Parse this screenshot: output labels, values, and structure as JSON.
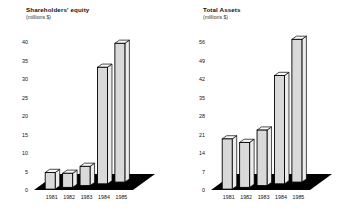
{
  "charts": [
    {
      "id": "shareholders-equity",
      "title": "Shareholders' equity",
      "subtitle": "(millions $)",
      "categories": [
        "1981",
        "1982",
        "1983",
        "1984",
        "1985"
      ],
      "values": [
        4.5,
        3.8,
        5.2,
        31.5,
        37.5
      ],
      "yticks": [
        "0",
        "5",
        "10",
        "15",
        "20",
        "25",
        "30",
        "35",
        "40"
      ],
      "ylim": [
        0,
        40
      ]
    },
    {
      "id": "total-assets",
      "title": "Total Assets",
      "subtitle": "(millions $)",
      "categories": [
        "1981",
        "1982",
        "1983",
        "1984",
        "1985"
      ],
      "values": [
        19,
        17,
        21,
        41,
        54
      ],
      "yticks": [
        "0",
        "7",
        "14",
        "21",
        "28",
        "35",
        "42",
        "49",
        "56"
      ],
      "ylim": [
        0,
        56
      ]
    }
  ],
  "chart_data": [
    {
      "type": "bar",
      "title": "Shareholders' equity",
      "subtitle": "(millions $)",
      "xlabel": "",
      "ylabel": "millions $",
      "categories": [
        "1981",
        "1982",
        "1983",
        "1984",
        "1985"
      ],
      "values": [
        4.5,
        3.8,
        5.2,
        31.5,
        37.5
      ],
      "ytick_labels": [
        "0",
        "5",
        "10",
        "15",
        "20",
        "25",
        "30",
        "35",
        "40"
      ],
      "ylim": [
        0,
        40
      ],
      "grid": false,
      "legend": "none",
      "style": "3d-perspective-bars",
      "bar_face_color": "#d9d9d9",
      "bar_outline_color": "#000000",
      "floor_color": "#000000"
    },
    {
      "type": "bar",
      "title": "Total Assets",
      "subtitle": "(millions $)",
      "xlabel": "",
      "ylabel": "millions $",
      "categories": [
        "1981",
        "1982",
        "1983",
        "1984",
        "1985"
      ],
      "values": [
        19,
        17,
        21,
        41,
        54
      ],
      "ytick_labels": [
        "0",
        "7",
        "14",
        "21",
        "28",
        "35",
        "42",
        "49",
        "56"
      ],
      "ylim": [
        0,
        56
      ],
      "grid": false,
      "legend": "none",
      "style": "3d-perspective-bars",
      "bar_face_color": "#d9d9d9",
      "bar_outline_color": "#000000",
      "floor_color": "#000000"
    }
  ]
}
